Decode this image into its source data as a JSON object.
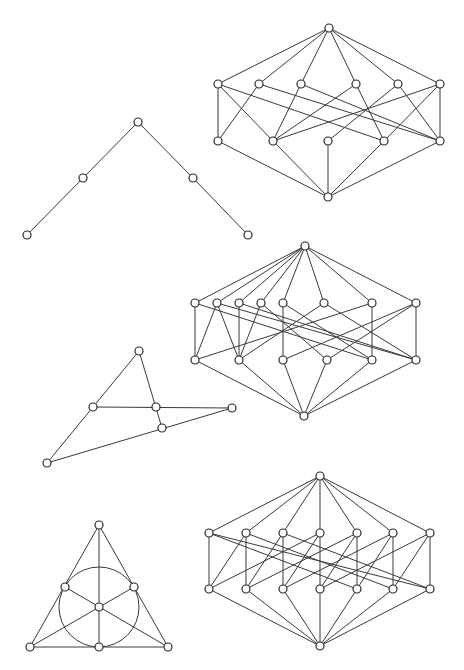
{
  "figures": [
    {
      "id": "lattice-1",
      "label": "Lattice with 1 + 6 + 5 + 1 elements",
      "levels": [
        [
          "t"
        ],
        [
          "a1",
          "a2",
          "a3",
          "a4",
          "a5",
          "a6"
        ],
        [
          "b1",
          "b2",
          "b3",
          "b4",
          "b5"
        ],
        [
          "z"
        ]
      ],
      "edges": [
        [
          "t",
          "a1"
        ],
        [
          "t",
          "a2"
        ],
        [
          "t",
          "a3"
        ],
        [
          "t",
          "a4"
        ],
        [
          "t",
          "a5"
        ],
        [
          "t",
          "a6"
        ],
        [
          "a1",
          "b1"
        ],
        [
          "a1",
          "b2"
        ],
        [
          "a1",
          "b4"
        ],
        [
          "a2",
          "b1"
        ],
        [
          "a2",
          "b5"
        ],
        [
          "a3",
          "b2"
        ],
        [
          "a3",
          "b5"
        ],
        [
          "a4",
          "b2"
        ],
        [
          "a4",
          "b4"
        ],
        [
          "a5",
          "b3"
        ],
        [
          "a5",
          "b5"
        ],
        [
          "a6",
          "b5"
        ],
        [
          "a6",
          "b2"
        ],
        [
          "a6",
          "b4"
        ],
        [
          "b1",
          "z"
        ],
        [
          "b2",
          "z"
        ],
        [
          "b3",
          "z"
        ],
        [
          "b4",
          "z"
        ],
        [
          "b5",
          "z"
        ]
      ]
    },
    {
      "id": "chain-v",
      "label": "Two-branch poset (V shape)",
      "levels": [
        [
          "p"
        ],
        [
          "q1",
          "q2"
        ],
        [
          "r1",
          "r2"
        ]
      ],
      "edges": [
        [
          "p",
          "q1"
        ],
        [
          "q1",
          "r1"
        ],
        [
          "p",
          "q2"
        ],
        [
          "q2",
          "r2"
        ]
      ]
    },
    {
      "id": "lattice-2",
      "label": "Lattice with 1 + 8 + 6 + 1 elements",
      "levels": [
        [
          "t"
        ],
        [
          "a1",
          "a2",
          "a3",
          "a4",
          "a5",
          "a6",
          "a7",
          "a8"
        ],
        [
          "b1",
          "b2",
          "b3",
          "b4",
          "b5",
          "b6"
        ],
        [
          "z"
        ]
      ],
      "edges": [
        [
          "t",
          "a1"
        ],
        [
          "t",
          "a2"
        ],
        [
          "t",
          "a3"
        ],
        [
          "t",
          "a4"
        ],
        [
          "t",
          "a5"
        ],
        [
          "t",
          "a6"
        ],
        [
          "t",
          "a7"
        ],
        [
          "t",
          "a8"
        ],
        [
          "a1",
          "b1"
        ],
        [
          "a1",
          "b5"
        ],
        [
          "a2",
          "b1"
        ],
        [
          "a2",
          "b2"
        ],
        [
          "a2",
          "b6"
        ],
        [
          "a3",
          "b2"
        ],
        [
          "a3",
          "b6"
        ],
        [
          "a4",
          "b2"
        ],
        [
          "a4",
          "b4"
        ],
        [
          "a5",
          "b3"
        ],
        [
          "a5",
          "b5"
        ],
        [
          "a6",
          "b2"
        ],
        [
          "a6",
          "b6"
        ],
        [
          "a7",
          "b5"
        ],
        [
          "a7",
          "b1"
        ],
        [
          "a8",
          "b6"
        ],
        [
          "a8",
          "b3"
        ],
        [
          "a8",
          "b4"
        ],
        [
          "b1",
          "z"
        ],
        [
          "b2",
          "z"
        ],
        [
          "b3",
          "z"
        ],
        [
          "b4",
          "z"
        ],
        [
          "b5",
          "z"
        ],
        [
          "b6",
          "z"
        ]
      ]
    },
    {
      "id": "point-line-config",
      "label": "Configuration of 6 points on 4 lines",
      "points": [
        "A",
        "B",
        "C",
        "D",
        "E",
        "F"
      ],
      "lines": [
        [
          "A",
          "B",
          "F"
        ],
        [
          "A",
          "C",
          "E"
        ],
        [
          "B",
          "C",
          "D"
        ],
        [
          "F",
          "E",
          "D"
        ]
      ]
    },
    {
      "id": "fano-lattice",
      "label": "Lattice of the Fano plane (1 + 7 + 7 + 1)",
      "levels": [
        [
          "t"
        ],
        [
          "p1",
          "p2",
          "p3",
          "p4",
          "p5",
          "p6",
          "p7"
        ],
        [
          "l1",
          "l2",
          "l3",
          "l4",
          "l5",
          "l6",
          "l7"
        ],
        [
          "z"
        ]
      ],
      "incidence_rule": "point i lies on lines i, i-1, i-3 (mod 7)"
    },
    {
      "id": "fano-plane",
      "label": "Fano plane",
      "points": [
        "top",
        "left-mid",
        "right-mid",
        "center",
        "bottom-left",
        "bottom-mid",
        "bottom-right"
      ],
      "lines": [
        [
          "top",
          "left-mid",
          "bottom-left"
        ],
        [
          "top",
          "right-mid",
          "bottom-right"
        ],
        [
          "bottom-left",
          "bottom-mid",
          "bottom-right"
        ],
        [
          "top",
          "center",
          "bottom-mid"
        ],
        [
          "left-mid",
          "center",
          "bottom-right"
        ],
        [
          "right-mid",
          "center",
          "bottom-left"
        ],
        [
          "left-mid",
          "right-mid",
          "bottom-mid",
          "circle"
        ]
      ]
    }
  ]
}
